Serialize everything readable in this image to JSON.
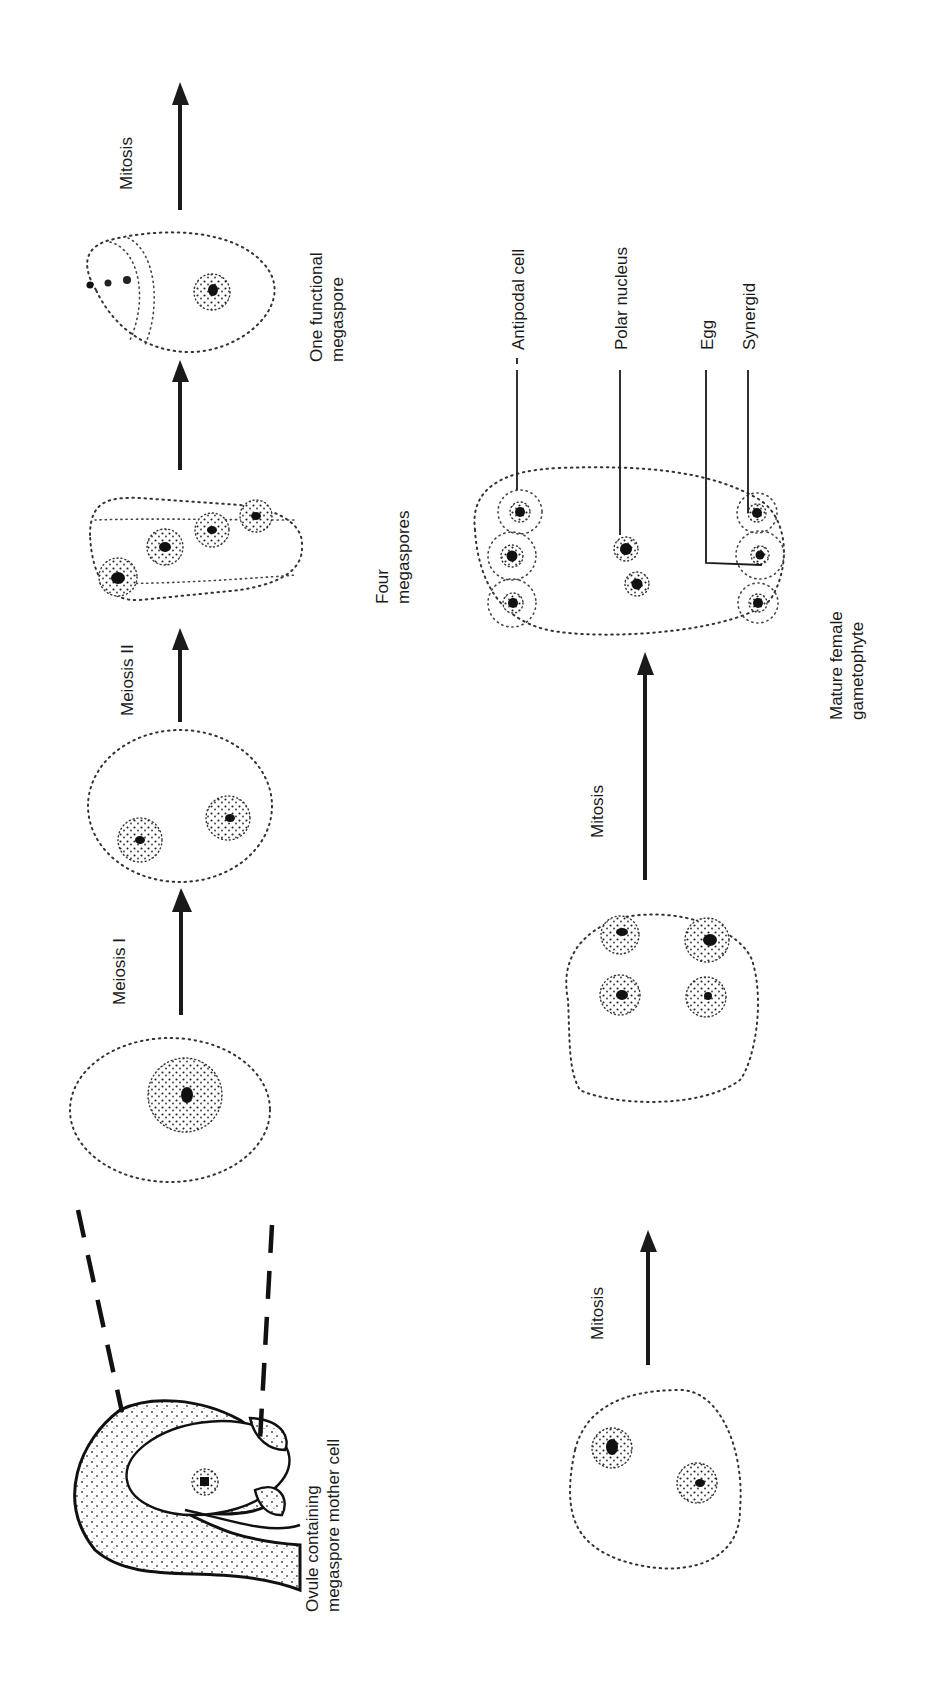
{
  "figure": {
    "orientation": "rotated-90-ccw",
    "background": "#ffffff",
    "ink_color": "#1a1a1a"
  },
  "top_row": {
    "stages": [
      {
        "id": "ovule",
        "label_line1": "Ovule containing",
        "label_line2": "megaspore mother cell"
      },
      {
        "id": "megaspore-mother-cell",
        "label_line1": "",
        "label_line2": ""
      },
      {
        "id": "two-cells",
        "label_line1": "",
        "label_line2": ""
      },
      {
        "id": "four-megaspores",
        "label_line1": "Four",
        "label_line2": "megaspores"
      },
      {
        "id": "functional-megaspore",
        "label_line1": "One functional",
        "label_line2": "megaspore"
      }
    ],
    "arrows": [
      {
        "id": "meiosis-1",
        "label": "Meiosis I"
      },
      {
        "id": "meiosis-2",
        "label": "Meiosis II"
      },
      {
        "id": "to-functional",
        "label": ""
      },
      {
        "id": "mitosis-top",
        "label": "Mitosis"
      }
    ]
  },
  "bottom_row": {
    "stages": [
      {
        "id": "two-nuclei",
        "label_line1": "",
        "label_line2": ""
      },
      {
        "id": "four-nuclei",
        "label_line1": "",
        "label_line2": ""
      },
      {
        "id": "mature-gametophyte",
        "label_line1": "Mature female",
        "label_line2": "gametophyte"
      }
    ],
    "arrows": [
      {
        "id": "mitosis-1",
        "label": "Mitosis"
      },
      {
        "id": "mitosis-2",
        "label": "Mitosis"
      }
    ],
    "callouts": [
      {
        "id": "antipodal",
        "label": "Antipodal cell"
      },
      {
        "id": "polar",
        "label": "Polar nucleus"
      },
      {
        "id": "egg",
        "label": "Egg"
      },
      {
        "id": "synergid",
        "label": "Synergid"
      }
    ]
  }
}
